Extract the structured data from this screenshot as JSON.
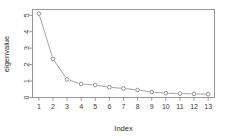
{
  "chart_data": {
    "type": "line",
    "title": "",
    "subtitle": "",
    "xlabel": "Index",
    "ylabel": "eigenvalue",
    "x": [
      1,
      2,
      3,
      4,
      5,
      6,
      7,
      8,
      9,
      10,
      11,
      12,
      13
    ],
    "values": [
      5.1,
      2.35,
      1.1,
      0.82,
      0.76,
      0.62,
      0.55,
      0.46,
      0.33,
      0.26,
      0.24,
      0.22,
      0.2
    ],
    "series": [
      {
        "name": "eigenvalue",
        "values": [
          5.1,
          2.35,
          1.1,
          0.82,
          0.76,
          0.62,
          0.55,
          0.46,
          0.33,
          0.26,
          0.24,
          0.22,
          0.2
        ]
      }
    ],
    "xticks": [
      1,
      2,
      3,
      4,
      5,
      6,
      7,
      8,
      9,
      10,
      11,
      12,
      13
    ],
    "xtick_labels": [
      "1",
      "2",
      "3",
      "4",
      "5",
      "6",
      "7",
      "8",
      "9",
      "10",
      "11",
      "12",
      "13"
    ],
    "yticks": [
      0,
      1,
      2,
      3,
      4,
      5
    ],
    "ytick_labels": [
      "0",
      "1",
      "2",
      "3",
      "4",
      "5"
    ],
    "xlim": [
      0.55,
      13.45
    ],
    "ylim": [
      0.0,
      5.35
    ],
    "grid": false,
    "legend": false,
    "legend_position": "none",
    "marker": "open-circle",
    "line_style": "solid",
    "colors": {
      "line": "#9a9a9a",
      "marker": "#7d7d7d",
      "frame": "#8c8c8c",
      "text": "#2b2b2b",
      "background": "#ffffff"
    }
  },
  "axes": {
    "x_title": "Index",
    "y_title": "eigenvalue"
  }
}
